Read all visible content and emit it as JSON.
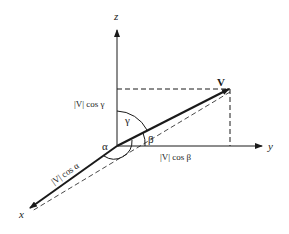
{
  "diagram": {
    "axes": {
      "z": "z",
      "y": "y",
      "x": "x"
    },
    "vector_label": "V",
    "angles": {
      "alpha": "α",
      "beta": "β",
      "gamma": "γ"
    },
    "components": {
      "z_component": "|V| cos γ",
      "y_component": "|V| cos β",
      "x_component": "|V| cos α"
    },
    "colors": {
      "line": "#1a1a1a",
      "background": "#ffffff"
    }
  }
}
